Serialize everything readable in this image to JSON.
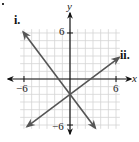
{
  "chart_data": {
    "type": "line",
    "title": "",
    "xlabel": "x",
    "ylabel": "y",
    "xlim": [
      -6.5,
      6.5
    ],
    "ylim": [
      -6.5,
      6.5
    ],
    "grid": true,
    "grid_step": 1,
    "x_ticks": [
      -6,
      6
    ],
    "y_ticks": [
      6,
      -6
    ],
    "x_tick_labels": [
      "−6",
      "6"
    ],
    "y_tick_labels": [
      "6",
      "−6"
    ],
    "series": [
      {
        "name": "i.",
        "label": "i.",
        "slope": -1.3333,
        "intercept": -2,
        "equation": "y = -4/3 x - 2",
        "x_start": -6.1,
        "x_end": 3.3,
        "arrows": "both"
      },
      {
        "name": "ii.",
        "label": "ii.",
        "slope": 0.75,
        "intercept": -2,
        "equation": "y = 3/4 x - 2",
        "x_start": -5.6,
        "x_end": 6.4,
        "arrows": "both"
      }
    ],
    "intersection": [
      0,
      -2
    ],
    "colors": {
      "lines": "#555555",
      "axes": "#111111",
      "grid": "#d4d4d4"
    }
  },
  "labels": {
    "x_axis": "x",
    "y_axis": "y",
    "x_neg": "−6",
    "x_pos": "6",
    "y_pos": "6",
    "y_neg": "−6",
    "line_i": "i.",
    "line_ii": "ii."
  }
}
